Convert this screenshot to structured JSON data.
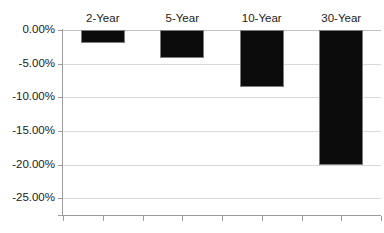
{
  "chart_data": {
    "type": "bar",
    "title": "",
    "xlabel": "",
    "ylabel": "",
    "categories": [
      "2-Year",
      "5-Year",
      "10-Year",
      "30-Year"
    ],
    "values": [
      -1.9,
      -4.2,
      -8.4,
      -20.1
    ],
    "series": [
      {
        "name": "Return",
        "values": [
          -1.9,
          -4.2,
          -8.4,
          -20.1
        ]
      }
    ],
    "ylim": [
      -27.5,
      0.0
    ],
    "ytick_values": [
      0.0,
      -5.0,
      -10.0,
      -15.0,
      -20.0,
      -25.0
    ],
    "ytick_labels": [
      "0.00%",
      "-5.00%",
      "-10.00%",
      "-15.00%",
      "-20.00%",
      "-25.00%"
    ],
    "grid": true,
    "legend": "none",
    "bar_color": "#0c0c0c",
    "bar_border_color": "#7d7d7d",
    "gridline_color": "#d9d9d9",
    "axis_color": "#9c9c9c",
    "text_color": "#1b1b1b",
    "background_color": "#ffffff",
    "value_axis_position": "top",
    "category_labels_position": "top"
  }
}
